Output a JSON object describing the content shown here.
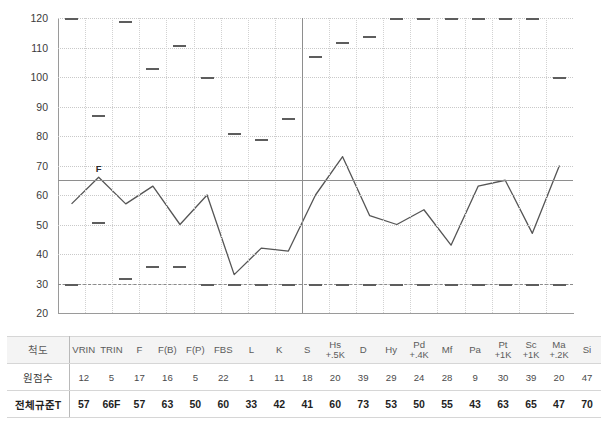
{
  "chart_data": {
    "type": "line",
    "title": "",
    "xlabel": "",
    "ylabel": "",
    "ylim": [
      20,
      120
    ],
    "ytick_step": 10,
    "yticks": [
      120,
      110,
      100,
      90,
      80,
      70,
      60,
      50,
      40,
      30,
      20
    ],
    "grid": true,
    "legend": "none",
    "reference_lines": [
      {
        "name": "T65-cutoff",
        "value": 65,
        "style": "solid",
        "color": "#8e8e8e"
      },
      {
        "name": "T30-floor",
        "value": 30,
        "style": "dashed",
        "color": "#8a8a8a"
      }
    ],
    "section_divider_after": "S",
    "annotations": [
      {
        "label": "F",
        "at": "TRIN",
        "value": 66
      }
    ],
    "categories": [
      "VRIN",
      "TRIN",
      "F",
      "F(B)",
      "F(P)",
      "FBS",
      "L",
      "K",
      "S",
      "Hs +.5K",
      "D",
      "Hy",
      "Pd +.4K",
      "Mf",
      "Pa",
      "Pt +1K",
      "Sc +1K",
      "Ma +.2K",
      "Si"
    ],
    "series": [
      {
        "name": "전체규준T",
        "values": [
          57,
          66,
          57,
          63,
          50,
          60,
          33,
          42,
          41,
          60,
          73,
          53,
          50,
          55,
          43,
          63,
          65,
          47,
          70
        ]
      },
      {
        "name": "upper-bound-markers",
        "type": "marker",
        "values": [
          120,
          87,
          119,
          103,
          111,
          100,
          81,
          79,
          86,
          107,
          112,
          114,
          120,
          120,
          120,
          120,
          120,
          120,
          100
        ]
      },
      {
        "name": "lower-bound-markers",
        "type": "marker",
        "values": [
          30,
          51,
          32,
          36,
          36,
          30,
          30,
          30,
          30,
          30,
          30,
          30,
          30,
          30,
          30,
          30,
          30,
          30,
          30
        ]
      }
    ]
  },
  "table": {
    "row_labels": [
      "척도",
      "원점수",
      "전체규준T"
    ],
    "columns": [
      {
        "name": "VRIN",
        "sub": ""
      },
      {
        "name": "TRIN",
        "sub": ""
      },
      {
        "name": "F",
        "sub": ""
      },
      {
        "name": "F(B)",
        "sub": ""
      },
      {
        "name": "F(P)",
        "sub": ""
      },
      {
        "name": "FBS",
        "sub": ""
      },
      {
        "name": "L",
        "sub": ""
      },
      {
        "name": "K",
        "sub": ""
      },
      {
        "name": "S",
        "sub": ""
      },
      {
        "name": "Hs",
        "sub": "+.5K"
      },
      {
        "name": "D",
        "sub": ""
      },
      {
        "name": "Hy",
        "sub": ""
      },
      {
        "name": "Pd",
        "sub": "+.4K"
      },
      {
        "name": "Mf",
        "sub": ""
      },
      {
        "name": "Pa",
        "sub": ""
      },
      {
        "name": "Pt",
        "sub": "+1K"
      },
      {
        "name": "Sc",
        "sub": "+1K"
      },
      {
        "name": "Ma",
        "sub": "+.2K"
      },
      {
        "name": "Si",
        "sub": ""
      }
    ],
    "raw_scores": [
      "12",
      "5",
      "17",
      "16",
      "5",
      "22",
      "1",
      "11",
      "18",
      "20",
      "39",
      "29",
      "24",
      "28",
      "9",
      "30",
      "39",
      "20",
      "47"
    ],
    "norm_t_scores": [
      "57",
      "66F",
      "57",
      "63",
      "50",
      "60",
      "33",
      "42",
      "41",
      "60",
      "73",
      "53",
      "50",
      "55",
      "43",
      "63",
      "65",
      "47",
      "70"
    ]
  },
  "colors": {
    "series_line": "#555555",
    "marker": "#5d5d5d",
    "reference": "#8e8e8e",
    "grid": "#cfcfcf",
    "axis": "#9a9a9a",
    "table_header_bg": "#f4f4f4"
  }
}
